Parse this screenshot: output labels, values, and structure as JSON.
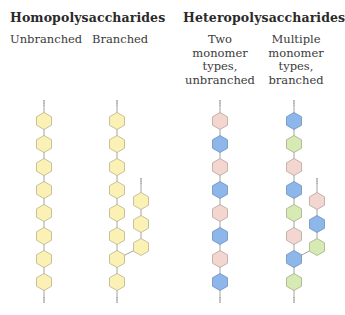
{
  "groups": [
    {
      "title": "Homopolysaccharides",
      "columns": [
        {
          "label": "Unbranched"
        },
        {
          "label": "Branched"
        }
      ]
    },
    {
      "title": "Heteropolysaccharides",
      "columns": [
        {
          "label_lines": [
            "Two",
            "monomer",
            "types,",
            "unbranched"
          ]
        },
        {
          "label_lines": [
            "Multiple",
            "monomer",
            "types,",
            "branched"
          ]
        }
      ]
    }
  ],
  "colors": {
    "yellow": "#fcf1b4",
    "yellow_stroke": "#b9b28c",
    "pink": "#f2d6cf",
    "pink_stroke": "#b9a39e",
    "blue": "#8db6ea",
    "blue_stroke": "#6f8fba",
    "green": "#d7eab4",
    "green_stroke": "#9fb088",
    "bond": "#9a9a9a"
  },
  "chains": [
    {
      "name": "homo-unbranched",
      "x": 44,
      "main": [
        "yellow",
        "yellow",
        "yellow",
        "yellow",
        "yellow",
        "yellow",
        "yellow",
        "yellow"
      ]
    },
    {
      "name": "homo-branched",
      "x": 117,
      "main": [
        "yellow",
        "yellow",
        "yellow",
        "yellow",
        "yellow",
        "yellow",
        "yellow",
        "yellow"
      ],
      "branch": {
        "x": 141,
        "from_index": 6,
        "units": [
          "yellow",
          "yellow",
          "yellow"
        ]
      }
    },
    {
      "name": "hetero-two-types-unbranched",
      "x": 220,
      "main": [
        "pink",
        "blue",
        "pink",
        "blue",
        "pink",
        "blue",
        "pink",
        "blue"
      ]
    },
    {
      "name": "hetero-multiple-types-branched",
      "x": 294,
      "main": [
        "blue",
        "green",
        "pink",
        "blue",
        "green",
        "pink",
        "blue",
        "green"
      ],
      "branch": {
        "x": 317,
        "from_index": 6,
        "units": [
          "pink",
          "blue",
          "green"
        ]
      }
    }
  ]
}
